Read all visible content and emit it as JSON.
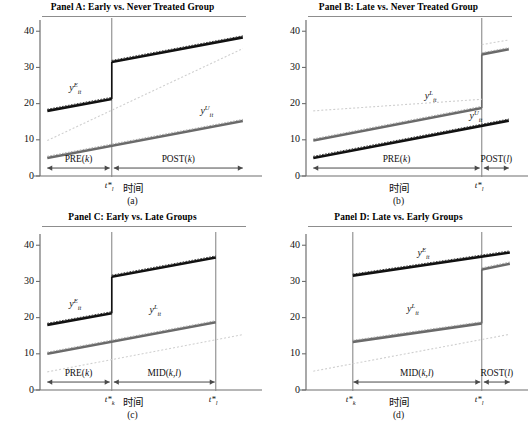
{
  "figure": {
    "width": 531,
    "height": 428,
    "background": "#ffffff",
    "axis_color": "#6f6f6f",
    "series_colors": {
      "treated_dark": "#111111",
      "comparison_gray": "#6a6a6a",
      "ghost_light": "#cfcfcf"
    }
  },
  "panels": [
    {
      "id": "a",
      "title": "Panel A: Early vs. Never Treated Group",
      "caption": "(a)",
      "xlabel": "时间",
      "yticks": [
        "0",
        "10",
        "20",
        "30",
        "40"
      ],
      "ytick_values": [
        0,
        10,
        20,
        30,
        40
      ],
      "ylim": [
        0,
        42
      ],
      "cut_labels": [
        {
          "text": "t*",
          "sub": "l",
          "x_frac": 0.345
        }
      ],
      "series_labels": [
        {
          "base": "y",
          "sup": "E",
          "sub": "it",
          "x_frac": 0.17,
          "y_val": 24.0
        },
        {
          "base": "y",
          "sup": "U",
          "sub": "it",
          "x_frac": 0.8,
          "y_val": 17.6
        }
      ],
      "spans": [
        {
          "label": "PRE(",
          "arg": "k",
          "close": ")",
          "from_frac": 0.035,
          "to_frac": 0.335,
          "y_val": 2.2
        },
        {
          "label": "POST(",
          "arg": "k",
          "close": ")",
          "from_frac": 0.355,
          "to_frac": 0.975,
          "y_val": 2.2
        }
      ],
      "chart_data": {
        "type": "line",
        "title": "Panel A: Early vs. Never Treated Group",
        "xlabel": "时间",
        "ylabel": "",
        "ylim": [
          0,
          42
        ],
        "grid": false,
        "legend": "inline-annotations",
        "treatment_time_frac": 0.345,
        "series": [
          {
            "name": "y^E_it (early treated)",
            "style": "solid-thick-dark",
            "segments": [
              {
                "x_frac": [
                  0.035,
                  0.345
                ],
                "values": [
                  18.0,
                  21.3
                ]
              },
              {
                "x_frac": [
                  0.345,
                  0.975
                ],
                "values": [
                  31.5,
                  38.3
                ]
              }
            ],
            "jump": 10.2
          },
          {
            "name": "y^U_it (never treated)",
            "style": "solid-thick-gray",
            "segments": [
              {
                "x_frac": [
                  0.035,
                  0.975
                ],
                "values": [
                  5.0,
                  15.2
                ]
              }
            ],
            "jump": 0
          },
          {
            "name": "counterfactual (dotted)",
            "style": "dotted-light",
            "segments": [
              {
                "x_frac": [
                  0.035,
                  0.975
                ],
                "values": [
                  9.8,
                  35.2
                ]
              }
            ]
          }
        ]
      }
    },
    {
      "id": "b",
      "title": "Panel B: Late vs. Never Treated Group",
      "caption": "(b)",
      "xlabel": "时间",
      "yticks": [
        "0",
        "10",
        "20",
        "30",
        "40"
      ],
      "ytick_values": [
        0,
        10,
        20,
        30,
        40
      ],
      "ylim": [
        0,
        42
      ],
      "cut_labels": [
        {
          "text": "t*",
          "sub": "l",
          "x_frac": 0.845
        }
      ],
      "series_labels": [
        {
          "base": "y",
          "sup": "L",
          "sub": "it",
          "x_frac": 0.6,
          "y_val": 21.8
        },
        {
          "base": "y",
          "sup": "U",
          "sub": "it",
          "x_frac": 0.815,
          "y_val": 16.2
        }
      ],
      "spans": [
        {
          "label": "PRE(",
          "arg": "k",
          "close": ")",
          "from_frac": 0.035,
          "to_frac": 0.835,
          "y_val": 2.2
        },
        {
          "label": "POST(",
          "arg": "l",
          "close": ")",
          "from_frac": 0.855,
          "to_frac": 0.975,
          "y_val": 2.2
        }
      ],
      "chart_data": {
        "type": "line",
        "title": "Panel B: Late vs. Never Treated Group",
        "xlabel": "时间",
        "ylabel": "",
        "ylim": [
          0,
          42
        ],
        "grid": false,
        "treatment_time_frac": 0.845,
        "series": [
          {
            "name": "y^L_it (late treated)",
            "style": "solid-thick-gray",
            "segments": [
              {
                "x_frac": [
                  0.035,
                  0.845
                ],
                "values": [
                  9.8,
                  18.8
                ]
              },
              {
                "x_frac": [
                  0.845,
                  0.975
                ],
                "values": [
                  33.6,
                  35.0
                ]
              }
            ],
            "jump": 14.8
          },
          {
            "name": "y^U_it (never treated)",
            "style": "solid-thick-dark",
            "segments": [
              {
                "x_frac": [
                  0.035,
                  0.975
                ],
                "values": [
                  5.0,
                  15.3
                ]
              }
            ],
            "jump": 0
          },
          {
            "name": "counterfactual upper (dotted)",
            "style": "dotted-light",
            "segments": [
              {
                "x_frac": [
                  0.035,
                  0.845
                ],
                "values": [
                  18.0,
                  21.2
                ]
              },
              {
                "x_frac": [
                  0.845,
                  0.975
                ],
                "values": [
                  36.3,
                  37.6
                ]
              }
            ]
          }
        ]
      }
    },
    {
      "id": "c",
      "title": "Panel C: Early vs. Late Groups",
      "caption": "(c)",
      "xlabel": "时间",
      "yticks": [
        "0",
        "10",
        "20",
        "30",
        "40"
      ],
      "ytick_values": [
        0,
        10,
        20,
        30,
        40
      ],
      "ylim": [
        0,
        42
      ],
      "cut_labels": [
        {
          "text": "t*",
          "sub": "k",
          "x_frac": 0.345
        },
        {
          "text": "t*",
          "sub": "l",
          "x_frac": 0.845
        }
      ],
      "series_labels": [
        {
          "base": "y",
          "sup": "E",
          "sub": "it",
          "x_frac": 0.17,
          "y_val": 23.6
        },
        {
          "base": "y",
          "sup": "L",
          "sub": "it",
          "x_frac": 0.555,
          "y_val": 21.8
        }
      ],
      "spans": [
        {
          "label": "PRE(",
          "arg": "k",
          "close": ")",
          "from_frac": 0.035,
          "to_frac": 0.335,
          "y_val": 2.2
        },
        {
          "label": "MID(",
          "arg": "k,l",
          "close": ")",
          "from_frac": 0.355,
          "to_frac": 0.84,
          "y_val": 2.2
        }
      ],
      "chart_data": {
        "type": "line",
        "title": "Panel C: Early vs. Late Groups",
        "xlabel": "时间",
        "ylabel": "",
        "ylim": [
          0,
          42
        ],
        "grid": false,
        "treatment_time_fracs": [
          0.345,
          0.845
        ],
        "series": [
          {
            "name": "y^E_it (early treated)",
            "style": "solid-thick-dark",
            "segments": [
              {
                "x_frac": [
                  0.035,
                  0.345
                ],
                "values": [
                  18.0,
                  21.2
                ]
              },
              {
                "x_frac": [
                  0.345,
                  0.845
                ],
                "values": [
                  31.3,
                  36.6
                ]
              }
            ],
            "jump": 10.1
          },
          {
            "name": "y^L_it (late treated)",
            "style": "solid-thick-gray",
            "segments": [
              {
                "x_frac": [
                  0.035,
                  0.845
                ],
                "values": [
                  10.0,
                  18.7
                ]
              }
            ],
            "jump": 0
          },
          {
            "name": "counterfactual (dotted)",
            "style": "dotted-light",
            "segments": [
              {
                "x_frac": [
                  0.035,
                  0.975
                ],
                "values": [
                  5.0,
                  15.3
                ]
              }
            ]
          }
        ]
      }
    },
    {
      "id": "d",
      "title": "Panel D: Late vs. Early Groups",
      "caption": "(d)",
      "xlabel": "时间",
      "yticks": [
        "0",
        "10",
        "20",
        "30",
        "40"
      ],
      "ytick_values": [
        0,
        10,
        20,
        30,
        40
      ],
      "ylim": [
        0,
        42
      ],
      "cut_labels": [
        {
          "text": "t*",
          "sub": "k",
          "x_frac": 0.225
        },
        {
          "text": "t*",
          "sub": "l",
          "x_frac": 0.845
        }
      ],
      "series_labels": [
        {
          "base": "y",
          "sup": "E",
          "sub": "it",
          "x_frac": 0.565,
          "y_val": 37.7
        },
        {
          "base": "y",
          "sup": "L",
          "sub": "it",
          "x_frac": 0.515,
          "y_val": 22.2
        }
      ],
      "spans": [
        {
          "label": "MID(",
          "arg": "k,l",
          "close": ")",
          "from_frac": 0.228,
          "to_frac": 0.838,
          "y_val": 2.2
        },
        {
          "label": "ROST(",
          "arg": "l",
          "close": ")",
          "from_frac": 0.855,
          "to_frac": 0.98,
          "y_val": 2.2
        }
      ],
      "chart_data": {
        "type": "line",
        "title": "Panel D: Late vs. Early Groups",
        "xlabel": "时间",
        "ylabel": "",
        "ylim": [
          0,
          42
        ],
        "grid": false,
        "treatment_time_fracs": [
          0.225,
          0.845
        ],
        "series": [
          {
            "name": "y^E_it (early treated)",
            "style": "solid-thick-dark",
            "segments": [
              {
                "x_frac": [
                  0.225,
                  0.98
                ],
                "values": [
                  31.6,
                  38.0
                ]
              }
            ],
            "jump": 0
          },
          {
            "name": "y^L_it (late treated)",
            "style": "solid-thick-gray",
            "segments": [
              {
                "x_frac": [
                  0.225,
                  0.845
                ],
                "values": [
                  13.3,
                  18.4
                ]
              },
              {
                "x_frac": [
                  0.845,
                  0.98
                ],
                "values": [
                  33.3,
                  34.9
                ]
              }
            ],
            "jump": 14.9
          },
          {
            "name": "counterfactual (dotted)",
            "style": "dotted-light",
            "segments": [
              {
                "x_frac": [
                  0.035,
                  0.98
                ],
                "values": [
                  5.2,
                  15.4
                ]
              }
            ]
          }
        ]
      }
    }
  ]
}
